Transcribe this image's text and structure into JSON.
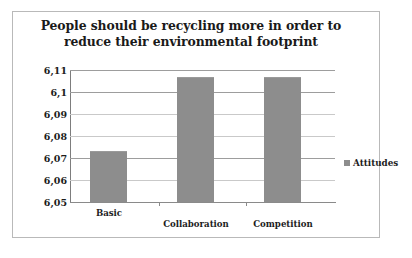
{
  "chart_data": {
    "type": "bar",
    "title": "People should be recycling more in order to reduce their environmental footprint",
    "title_lines": [
      "People should be recycling more in order to",
      "reduce their environmental footprint"
    ],
    "categories": [
      "Basic",
      "Collaboration",
      "Competition"
    ],
    "series": [
      {
        "name": "Attitudes",
        "values": [
          6.073,
          6.107,
          6.107
        ],
        "color": "#8d8d8d"
      }
    ],
    "values": [
      6.073,
      6.107,
      6.107
    ],
    "xlabel": "",
    "ylabel": "",
    "ylim": [
      6.05,
      6.11
    ],
    "ytick_values": [
      6.11,
      6.1,
      6.09,
      6.08,
      6.07,
      6.06,
      6.05
    ],
    "ytick_labels": [
      "6,11",
      "6,1",
      "6,09",
      "6,08",
      "6,07",
      "6,06",
      "6,05"
    ],
    "decimal_separator": ",",
    "grid": true,
    "grid_axis": "y",
    "legend": {
      "entries": [
        "Attitudes"
      ],
      "position": "right"
    },
    "colors": {
      "bar": "#8d8d8d",
      "background": "#ffffff",
      "border": "#b9b9b9",
      "gridline": "#9d9d9d",
      "text": "#1c1c1c"
    }
  }
}
